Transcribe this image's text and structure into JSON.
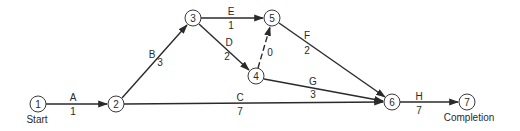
{
  "diagram": {
    "type": "activity-on-arrow network",
    "nodes": [
      {
        "id": "1",
        "label": "1",
        "x": 38,
        "y": 104,
        "caption": "Start"
      },
      {
        "id": "2",
        "label": "2",
        "x": 116,
        "y": 104
      },
      {
        "id": "3",
        "label": "3",
        "x": 193,
        "y": 18
      },
      {
        "id": "4",
        "label": "4",
        "x": 256,
        "y": 76
      },
      {
        "id": "5",
        "label": "5",
        "x": 272,
        "y": 18
      },
      {
        "id": "6",
        "label": "6",
        "x": 392,
        "y": 102
      },
      {
        "id": "7",
        "label": "7",
        "x": 467,
        "y": 102,
        "caption": "Completion"
      }
    ],
    "edges": [
      {
        "activity": "A",
        "duration": "1",
        "from": "1",
        "to": "2",
        "dashed": false
      },
      {
        "activity": "B",
        "duration": "3",
        "from": "2",
        "to": "3",
        "dashed": false
      },
      {
        "activity": "C",
        "duration": "7",
        "from": "2",
        "to": "6",
        "dashed": false
      },
      {
        "activity": "D",
        "duration": "2",
        "from": "3",
        "to": "4",
        "dashed": false
      },
      {
        "activity": "E",
        "duration": "1",
        "from": "3",
        "to": "5",
        "dashed": false
      },
      {
        "activity": "",
        "duration": "0",
        "from": "4",
        "to": "5",
        "dashed": true
      },
      {
        "activity": "F",
        "duration": "2",
        "from": "5",
        "to": "6",
        "dashed": false
      },
      {
        "activity": "G",
        "duration": "3",
        "from": "4",
        "to": "6",
        "dashed": false
      },
      {
        "activity": "H",
        "duration": "7",
        "from": "6",
        "to": "7",
        "dashed": false
      }
    ],
    "captions": {
      "start": "Start",
      "completion": "Completion"
    },
    "colors": {
      "line": "#2a2a2a",
      "node_stroke": "#3a3a3a",
      "background": "#ffffff"
    }
  }
}
